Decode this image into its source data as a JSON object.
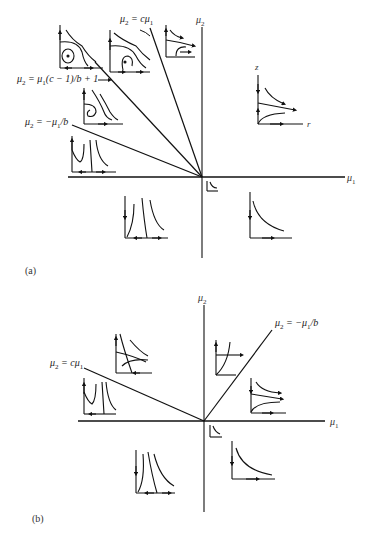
{
  "diagram": {
    "type": "bifurcation-phase-portraits",
    "panels": [
      {
        "tag": "(a)",
        "axes": {
          "x_label": "μ1",
          "y_label": "μ2"
        },
        "boundary_lines": [
          {
            "label_prefix": "μ",
            "label_sub": "2",
            "label_rest": " = cμ",
            "label_sub2": "1",
            "equation": "μ2 = cμ1"
          },
          {
            "label_prefix": "μ",
            "label_sub": "2",
            "label_rest": " = μ",
            "label_sub2": "1",
            "label_tail": "(c − 1)/b + 1",
            "equation": "μ2 = μ1(c − 1)/b + 1"
          },
          {
            "label_prefix": "μ",
            "label_sub": "2",
            "label_rest": " = −μ",
            "label_sub2": "1",
            "label_tail": "/b",
            "equation": "μ2 = −μ1/b"
          }
        ],
        "inset_axes": {
          "z_label": "z",
          "r_label": "r"
        },
        "portraits": [
          "center-with-closed-orbit",
          "unstable-spiral",
          "saddle-node-flow",
          "spiral-sink",
          "stable-node-left",
          "node-z-axis",
          "small-origin",
          "lower-left-flow",
          "lower-right-hyperbola"
        ]
      },
      {
        "tag": "(b)",
        "axes": {
          "x_label": "μ1",
          "y_label": "μ2"
        },
        "boundary_lines": [
          {
            "label_prefix": "μ",
            "label_sub": "2",
            "label_rest": " = −μ",
            "label_sub2": "1",
            "label_tail": "/b",
            "equation": "μ2 = −μ1/b"
          },
          {
            "label_prefix": "μ",
            "label_sub": "2",
            "label_rest": " = cμ",
            "label_sub2": "1",
            "equation": "μ2 = cμ1"
          }
        ],
        "portraits": [
          "saddle-crossing",
          "node-left-region",
          "upper-right-node",
          "right-saddle",
          "small-origin",
          "lower-left-flow",
          "lower-right-hyperbola"
        ]
      }
    ]
  }
}
